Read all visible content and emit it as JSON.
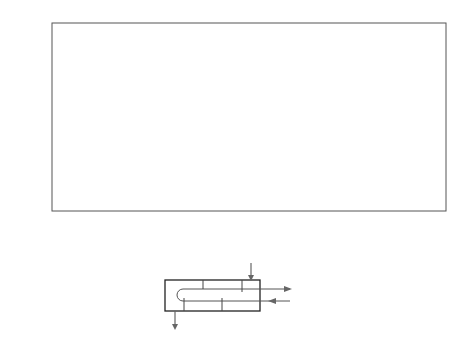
{
  "chart_data": {
    "type": "line",
    "title": "",
    "xlabel": "P = (T_t,out − T_t,in)/(T_s,in − T_t,in)",
    "ylabel": "F",
    "xlim": [
      0,
      1.0
    ],
    "ylim": [
      0.5,
      1.0
    ],
    "x_ticks": [
      "0",
      "0.1",
      "0.2",
      "0.3",
      "0.4",
      "0.5",
      "0.6",
      "0.7",
      "0.8",
      "0.9",
      "1.0"
    ],
    "y_ticks": [
      "0.5",
      "0.6",
      "0.7",
      "0.8",
      "0.9",
      "1.0"
    ],
    "grid": true,
    "legend": "none (curves labeled inline)",
    "curve_parameter": "Z",
    "series": [
      {
        "name": "Z = 0.1",
        "label": "Z = 0.1",
        "P_at_F_0.5": 0.953
      },
      {
        "name": "0.2",
        "label": "0.2",
        "P_at_F_0.5": 0.85
      },
      {
        "name": "0.3",
        "label": "0.3",
        "P_at_F_0.5": 0.8
      },
      {
        "name": "0.4",
        "label": "0.4",
        "P_at_F_0.5": 0.751
      },
      {
        "name": "0.5",
        "label": "0.5",
        "P_at_F_0.5": 0.708
      },
      {
        "name": "0.6",
        "label": "0.6",
        "P_at_F_0.5": 0.67
      },
      {
        "name": "0.7",
        "label": "0.7",
        "P_at_F_0.5": 0.637
      },
      {
        "name": "0.8",
        "label": "0.8",
        "P_at_F_0.5": 0.599
      },
      {
        "name": "0.9",
        "label": "0.9",
        "P_at_F_0.5": 0.571
      },
      {
        "name": "1.0",
        "label": "1.0",
        "P_at_F_0.5": 0.541
      },
      {
        "name": "1.2",
        "label": "1.2",
        "P_at_F_0.5": 0.51
      },
      {
        "name": "1.4",
        "label": "1.4",
        "P_at_F_0.5": 0.475
      },
      {
        "name": "1.6",
        "label": "1.6",
        "P_at_F_0.5": 0.449
      },
      {
        "name": "1.8",
        "label": "1.8",
        "P_at_F_0.5": 0.406
      },
      {
        "name": "2.0",
        "label": "2.0",
        "P_at_F_0.5": 0.376
      },
      {
        "name": "2.5",
        "label": "2.5",
        "P_at_F_0.5": 0.317
      },
      {
        "name": "3.0",
        "label": "3.0",
        "P_at_F_0.5": 0.279
      },
      {
        "name": "4.0",
        "label": "4.0",
        "P_at_F_0.5": 0.219
      },
      {
        "name": "6.0",
        "label": "6.0",
        "P_at_F_0.5": 0.155
      },
      {
        "name": "8.0",
        "label": "8.0",
        "P_at_F_0.5": 0.119
      },
      {
        "name": "10.0",
        "label": "10.0",
        "P_at_F_0.5": 0.097
      },
      {
        "name": "15.0",
        "label": "15.0",
        "P_at_F_0.5": 0.066
      },
      {
        "name": "20.0",
        "label": "20.0",
        "P_at_F_0.5": 0.05
      }
    ]
  },
  "figure": {
    "y_axis_label": "F",
    "x_axis_label_parts": {
      "P": "P",
      "eq": " = (",
      "T1": "T",
      "T1_sub": "t, out",
      "minus1": " − ",
      "T2": "T",
      "T2_sub": "t, in",
      "mid": ")/(",
      "T3": "T",
      "T3_sub": "s, in",
      "minus2": " − ",
      "T4": "T",
      "T4_sub": "t, in",
      "end": ")"
    },
    "schematic": {
      "shell_in": {
        "T": "T",
        "sub": "s, in"
      },
      "shell_out": {
        "T": "T",
        "sub": "s, out"
      },
      "tube_out": {
        "T": "T",
        "sub": "t, out"
      },
      "tube_in": {
        "T": "T",
        "sub": "t, in"
      }
    }
  }
}
